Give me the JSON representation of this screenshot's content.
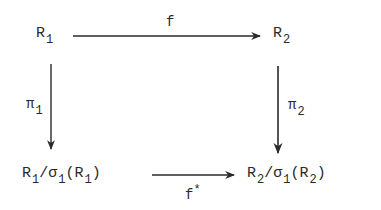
{
  "diagram": {
    "type": "commutative-square",
    "nodes": {
      "top_left": {
        "base": "R",
        "sub": "1"
      },
      "top_right": {
        "base": "R",
        "sub": "2"
      },
      "bottom_left": {
        "parts": [
          "R",
          "1",
          "/σ",
          "1",
          "(R",
          "1",
          ")"
        ]
      },
      "bottom_right": {
        "parts": [
          "R",
          "2",
          "/σ",
          "1",
          "(R",
          "2",
          ")"
        ]
      }
    },
    "arrows": {
      "top": {
        "label": "f",
        "from": "R1",
        "to": "R2"
      },
      "left": {
        "label": "π",
        "sub": "1",
        "from": "R1",
        "to": "R1/σ1(R1)"
      },
      "right": {
        "label": "π",
        "sub": "2",
        "from": "R2",
        "to": "R2/σ1(R2)"
      },
      "bottom": {
        "label": "f",
        "sup": "*",
        "from": "R1/σ1(R1)",
        "to": "R2/σ1(R2)"
      }
    },
    "stroke_color": "#2a2a2a"
  }
}
